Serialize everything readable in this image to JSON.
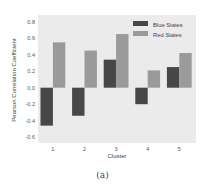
{
  "chart_data": {
    "type": "bar",
    "title": "",
    "xlabel": "Cluster",
    "ylabel": "Pearson Correlation Coefficient",
    "categories": [
      "1",
      "2",
      "3",
      "4",
      "5"
    ],
    "series": [
      {
        "name": "Blue States",
        "color": "#474747",
        "values": [
          -0.46,
          -0.34,
          0.34,
          -0.2,
          0.25
        ]
      },
      {
        "name": "Red States",
        "color": "#9a9a9a",
        "values": [
          0.55,
          0.45,
          0.65,
          0.21,
          0.42
        ]
      }
    ],
    "ylim": [
      -0.65,
      0.87
    ],
    "yticks": [
      "0.8",
      "0.6",
      "0.4",
      "0.2",
      "0.0",
      "-0.2",
      "-0.4",
      "-0.6"
    ],
    "ytick_values": [
      0.8,
      0.6,
      0.4,
      0.2,
      0.0,
      -0.2,
      -0.4,
      -0.6
    ],
    "grid": false,
    "legend_position": "upper right",
    "background": "#ebebeb"
  },
  "caption": "(a)"
}
